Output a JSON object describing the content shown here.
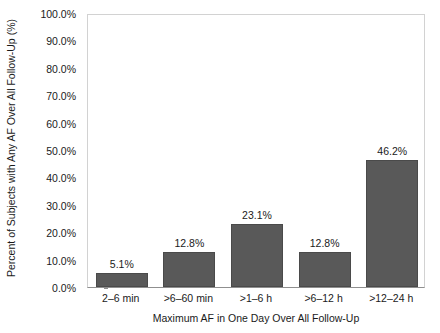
{
  "chart_data": {
    "type": "bar",
    "title": "",
    "subtitle": "",
    "xlabel": "Maximum AF in One Day Over All Follow-Up",
    "ylabel": "Percent of Subjects with Any AF Over All Follow-Up (%)",
    "categories": [
      "2–6 min",
      ">6–60 min",
      ">1–6 h",
      ">6–12 h",
      ">12–24 h"
    ],
    "values": [
      5.1,
      12.8,
      23.1,
      12.8,
      46.2
    ],
    "data_labels": [
      "5.1%",
      "12.8%",
      "23.1%",
      "12.8%",
      "46.2%"
    ],
    "ylim": [
      0,
      100
    ],
    "ytick_values": [
      0,
      10,
      20,
      30,
      40,
      50,
      60,
      70,
      80,
      90,
      100
    ],
    "ytick_labels": [
      "0.0%",
      "10.0%",
      "20.0%",
      "30.0%",
      "40.0%",
      "50.0%",
      "60.0%",
      "70.0%",
      "80.0%",
      "90.0%",
      "100.0%"
    ],
    "grid": false,
    "legend": false,
    "legend_position": "none",
    "bar_color": "#595959",
    "bar_edge_color": "#4a4a4a",
    "frame_color": "#d2d2d2",
    "axis_color": "#8f8f8f",
    "background_color": "#ffffff",
    "text_color": "#1a1a1a"
  }
}
